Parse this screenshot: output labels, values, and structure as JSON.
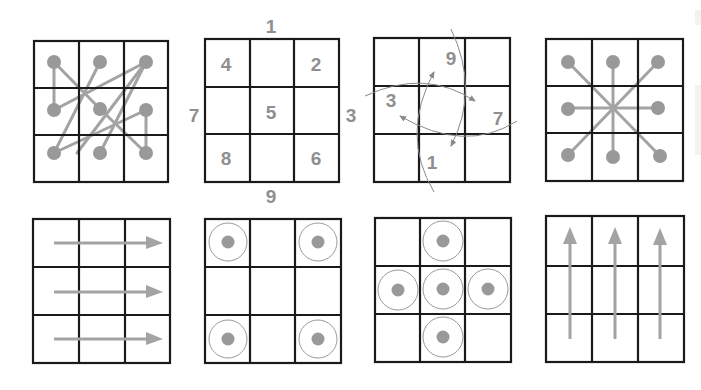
{
  "colors": {
    "grid_line": "#1a1a1a",
    "marker": "#999999",
    "connector": "#a3a3a3",
    "label": "#8f8f8f",
    "ring": "#9a9a9a",
    "background": "#ffffff"
  },
  "panels": [
    {
      "id": "zigzag-path",
      "description": "3x3 grid with dots in every cell connected by a crossing path"
    },
    {
      "id": "magic-square",
      "description": "3x3 grid with numbers in cells and around edges",
      "labels": {
        "top": "1",
        "left": "7",
        "right": "3",
        "bottom": "9",
        "cell_top_left": "4",
        "cell_top_right": "2",
        "cell_center": "5",
        "cell_bottom_left": "8",
        "cell_bottom_right": "6"
      }
    },
    {
      "id": "circular-rotation",
      "description": "3x3 grid with curved arrows rotating around center",
      "labels": {
        "top": "9",
        "left": "3",
        "right": "7",
        "bottom": "1"
      }
    },
    {
      "id": "star-radial",
      "description": "3x3 grid with center connected to all eight outer dots"
    },
    {
      "id": "horizontal-arrows",
      "description": "3x3 grid with three arrows pointing right, one per row"
    },
    {
      "id": "corner-targets",
      "description": "3x3 grid with ringed dots in four corner cells"
    },
    {
      "id": "cross-targets",
      "description": "3x3 grid with ringed dots in center and four edge cells"
    },
    {
      "id": "vertical-arrows",
      "description": "3x3 grid with three arrows pointing up, one per column"
    }
  ]
}
